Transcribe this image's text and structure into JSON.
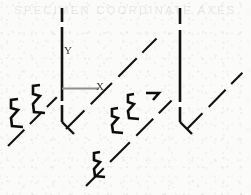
{
  "figure": {
    "kind": "technical-line-drawing",
    "title": "",
    "background_color": "#fbfbfa",
    "ink_color": "#111111",
    "ghost_text": "SPECIMEN  COORDINATE  AXES",
    "width": 251,
    "height": 195
  },
  "axes": {
    "y": {
      "label": "Y",
      "label_x": 64,
      "label_y": 45,
      "stroke": "#111111"
    },
    "x": {
      "label": "X",
      "label_x": 96,
      "label_y": 81,
      "stroke": "#8c8c8c"
    }
  },
  "geometry": {
    "vertical_lines": [
      {
        "name": "left-vertical-axis",
        "x": 62,
        "y1": 8,
        "y2": 122,
        "dash": "30 4 58 4 20"
      },
      {
        "name": "right-vertical-axis",
        "x": 180,
        "y1": 8,
        "y2": 122,
        "dash": "36 5 55 4 18"
      }
    ],
    "vertical_hooks": [
      {
        "name": "left-vertical-hook",
        "x1": 62,
        "y1": 122,
        "x2": 74,
        "y2": 134
      },
      {
        "name": "right-vertical-hook",
        "x1": 180,
        "y1": 122,
        "x2": 192,
        "y2": 134
      }
    ],
    "x_axis_segment": {
      "x1": 62,
      "y1": 88,
      "x2": 98,
      "y2": 88
    },
    "diagonals": [
      {
        "name": "diagonal-1",
        "x1": 8,
        "y1": 145,
        "x2": 60,
        "y2": 93
      },
      {
        "name": "diagonal-2",
        "x1": 66,
        "y1": 128,
        "x2": 172,
        "y2": 22
      },
      {
        "name": "diagonal-3",
        "x1": 86,
        "y1": 185,
        "x2": 178,
        "y2": 93
      },
      {
        "name": "diagonal-4",
        "x1": 186,
        "y1": 128,
        "x2": 248,
        "y2": 66
      }
    ],
    "zigzags": [
      {
        "name": "zigzag-1",
        "x": 10,
        "y": 97,
        "scale": 1.0
      },
      {
        "name": "zigzag-2",
        "x": 32,
        "y": 83,
        "scale": 1.0
      },
      {
        "name": "zigzag-3",
        "x": 112,
        "y": 106,
        "scale": 0.88
      },
      {
        "name": "zigzag-4",
        "x": 128,
        "y": 92,
        "scale": 0.88
      },
      {
        "name": "zigzag-5",
        "x": 94,
        "y": 150,
        "scale": 0.88
      },
      {
        "name": "arrow-tip-1",
        "x": 152,
        "y": 90
      }
    ]
  }
}
